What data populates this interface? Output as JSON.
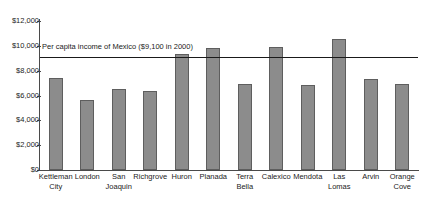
{
  "chart_data": {
    "type": "bar",
    "title": "",
    "xlabel": "",
    "ylabel": "",
    "ylim": [
      0,
      12000
    ],
    "ytick_values": [
      0,
      2000,
      4000,
      6000,
      8000,
      10000,
      12000
    ],
    "ytick_labels": [
      "$0",
      "$2,000",
      "$4,000",
      "$6,000",
      "$8,000",
      "$10,000",
      "$12,000"
    ],
    "grid": false,
    "legend": "none",
    "bar_color": "#8c8c8c",
    "bar_edge_color": "#5e5e5e",
    "axis_color": "#4a4a4a",
    "reference_line": {
      "label": "Per capita income of Mexico ($9,100 in 2000)",
      "value": 9100,
      "color": "#1a1a1a"
    },
    "categories": [
      "Kettleman City",
      "London",
      "San Joaquin",
      "Richgrove",
      "Huron",
      "Planada",
      "Terra Bella",
      "Calexico",
      "Mendota",
      "Las Lomas",
      "Arvin",
      "Orange Cove"
    ],
    "category_lines": [
      [
        "Kettleman",
        "City"
      ],
      [
        "London",
        ""
      ],
      [
        "San",
        "Joaquin"
      ],
      [
        "Richgrove",
        ""
      ],
      [
        "Huron",
        ""
      ],
      [
        "Planada",
        ""
      ],
      [
        "Terra",
        "Bella"
      ],
      [
        "Calexico",
        ""
      ],
      [
        "Mendota",
        ""
      ],
      [
        "Las",
        "Lomas"
      ],
      [
        "Arvin",
        ""
      ],
      [
        "Orange",
        "Cove"
      ]
    ],
    "values": [
      7400,
      5600,
      6550,
      6350,
      9350,
      9800,
      6950,
      9900,
      6850,
      10550,
      7300,
      6950
    ]
  }
}
